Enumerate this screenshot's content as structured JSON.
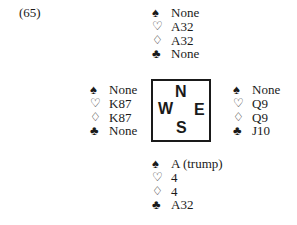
{
  "problem_label": "(65)",
  "suit_symbols": {
    "spades": "♠",
    "hearts": "♡",
    "diamonds": "♢",
    "clubs": "♣"
  },
  "compass": {
    "north": "N",
    "west": "W",
    "east": "E",
    "south": "S"
  },
  "hands": {
    "north": {
      "spades": "None",
      "hearts": "A32",
      "diamonds": "A32",
      "clubs": "None"
    },
    "west": {
      "spades": "None",
      "hearts": "K87",
      "diamonds": "K87",
      "clubs": "None"
    },
    "east": {
      "spades": "None",
      "hearts": "Q9",
      "diamonds": "Q9",
      "clubs": "J10"
    },
    "south": {
      "spades": "A (trump)",
      "hearts": "4",
      "diamonds": "4",
      "clubs": "A32"
    }
  }
}
